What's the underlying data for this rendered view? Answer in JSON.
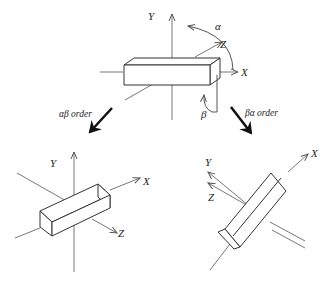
{
  "diagram": {
    "top": {
      "axes": {
        "x": "X",
        "y": "Y",
        "z": "Z"
      },
      "rotations": {
        "alpha": "α",
        "beta": "β"
      }
    },
    "arrows": {
      "left_label": "αβ order",
      "right_label": "βα order"
    },
    "bottom_left": {
      "axes": {
        "x": "X",
        "y": "Y",
        "z": "Z"
      }
    },
    "bottom_right": {
      "axes": {
        "x": "X",
        "y": "Y",
        "z": "Z"
      }
    }
  }
}
